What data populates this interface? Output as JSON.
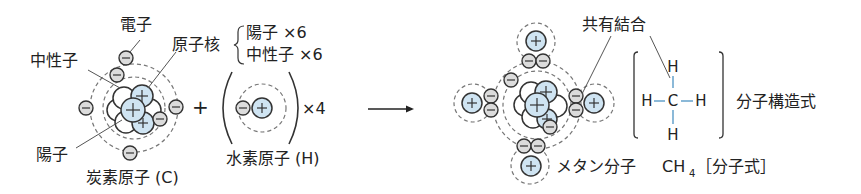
{
  "carbon_atom": {
    "name_label": "炭素原子 (C)",
    "electron_label": "電子",
    "neutron_label": "中性子",
    "nucleus_label": "原子核",
    "proton_label": "陽子",
    "nucleus_breakdown": [
      {
        "label": "陽子 ×6"
      },
      {
        "label": "中性子 ×6"
      }
    ]
  },
  "hydrogen_atom": {
    "name_label": "水素原子 (H)",
    "multiplier": "×4"
  },
  "operators": {
    "plus": "+",
    "arrow": "⟶"
  },
  "methane": {
    "molecule_label": "メタン分子",
    "covalent_bond_label": "共有結合",
    "structural_formula_label": "分子構造式",
    "molecular_formula": "CH",
    "molecular_formula_subscript": "4",
    "molecular_formula_label": "［分子式］",
    "structure": {
      "center": "C",
      "top": "H",
      "bottom": "H",
      "left": "H",
      "right": "H"
    }
  },
  "colors": {
    "proton_fill": "#cfe4f2",
    "electron_fill": "#dcdcdc",
    "bond_color": "#6fa8cf"
  }
}
